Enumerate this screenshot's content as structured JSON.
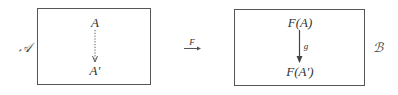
{
  "diagram": {
    "type": "functor-mapping",
    "source_category": {
      "label": "𝒜",
      "object_top": "A",
      "object_bottom": "A′",
      "arrow_style": "dotted"
    },
    "functor": {
      "label": "F",
      "arrow_style": "solid"
    },
    "target_category": {
      "label": "ℬ",
      "object_top": "F(A)",
      "object_bottom": "F(A′)",
      "morphism_label": "g",
      "arrow_style": "solid"
    }
  }
}
